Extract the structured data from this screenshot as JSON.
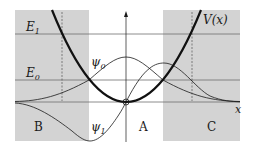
{
  "diagram": {
    "colors": {
      "forbidden_region": "#d3d3d3",
      "lines": "#1a1a1a",
      "energy_levels": "#6e6e6e",
      "background": "#ffffff"
    },
    "labels": {
      "potential": "V(x)",
      "E1": "E",
      "E1_sub": "1",
      "E0": "E",
      "E0_sub": "0",
      "psi0": "ψ",
      "psi0_sub": "0",
      "psi1": "ψ",
      "psi1_sub": "1",
      "x_axis": "x",
      "region_A": "A",
      "region_B": "B",
      "region_C": "C"
    },
    "regions": [
      {
        "name": "B",
        "description": "classically forbidden (left)"
      },
      {
        "name": "A",
        "description": "classically allowed (center)"
      },
      {
        "name": "C",
        "description": "classically forbidden (right)"
      }
    ],
    "energy_levels": [
      "E0",
      "E1"
    ],
    "curves": [
      "V(x) parabola",
      "ψ0 ground state",
      "ψ1 first excited state"
    ]
  }
}
